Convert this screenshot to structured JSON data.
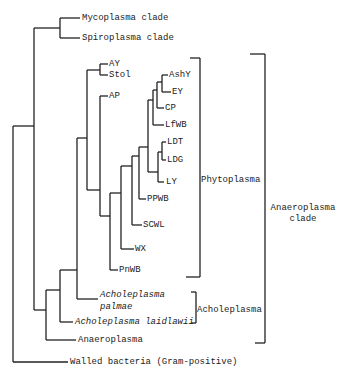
{
  "diagram": {
    "type": "phylogenetic-tree",
    "leaves": [
      {
        "id": "mycoplasma",
        "label": "Mycoplasma clade",
        "x": 82,
        "y": 18
      },
      {
        "id": "spiroplasma",
        "label": "Spiroplasma clade",
        "x": 82,
        "y": 38
      },
      {
        "id": "ay",
        "label": "AY",
        "x": 110,
        "y": 64
      },
      {
        "id": "stol",
        "label": "Stol",
        "x": 110,
        "y": 74
      },
      {
        "id": "ap",
        "label": "AP",
        "x": 110,
        "y": 95
      },
      {
        "id": "ashy",
        "label": "AshY",
        "x": 170,
        "y": 74
      },
      {
        "id": "ey",
        "label": "EY",
        "x": 173,
        "y": 92
      },
      {
        "id": "cp",
        "label": "CP",
        "x": 166,
        "y": 108
      },
      {
        "id": "lfwb",
        "label": "LfWB",
        "x": 166,
        "y": 124
      },
      {
        "id": "ldt",
        "label": "LDT",
        "x": 168,
        "y": 142
      },
      {
        "id": "ldg",
        "label": "LDG",
        "x": 168,
        "y": 160
      },
      {
        "id": "ly",
        "label": "LY",
        "x": 166,
        "y": 182
      },
      {
        "id": "ppwb",
        "label": "PPWB",
        "x": 148,
        "y": 198
      },
      {
        "id": "scwl",
        "label": "SCWL",
        "x": 144,
        "y": 224
      },
      {
        "id": "wx",
        "label": "WX",
        "x": 136,
        "y": 249
      },
      {
        "id": "pnwb",
        "label": "PnWB",
        "x": 120,
        "y": 270
      },
      {
        "id": "palmae",
        "label_line1": "Acholeplasma",
        "label_line2": "palmae",
        "x": 100,
        "y": 293
      },
      {
        "id": "laidlawii",
        "label": "Acholeplasma laidlawii",
        "x": 75,
        "y": 317
      },
      {
        "id": "anaeroplasma",
        "label": "Anaeroplasma",
        "x": 78,
        "y": 335
      },
      {
        "id": "walled",
        "label": "Walled bacteria (Gram-positive)",
        "x": 70,
        "y": 357
      }
    ],
    "brackets": {
      "phytoplasma": {
        "label": "Phytoplasma"
      },
      "acholeplasma": {
        "label": "Acholeplasma"
      },
      "anaeroplasma_clade": {
        "label_line1": "Anaeroplasma",
        "label_line2": "clade"
      }
    },
    "colors": {
      "line": "#222222",
      "background": "#ffffff"
    }
  }
}
